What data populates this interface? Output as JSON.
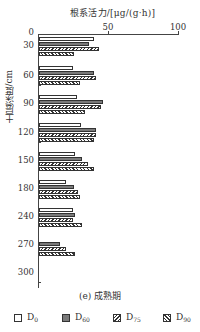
{
  "chart_data": {
    "type": "bar",
    "orientation": "horizontal",
    "title": "",
    "caption": "(e) 成熟期",
    "xlabel": "根系活力/[μg/(g·h)]",
    "ylabel": "土层深度/cm",
    "xlim": [
      0,
      100
    ],
    "x_ticks": [
      "50",
      "100"
    ],
    "categories": [
      "30",
      "60",
      "90",
      "120",
      "150",
      "180",
      "240",
      "270"
    ],
    "y_ticks": [
      "0",
      "30",
      "60",
      "90",
      "120",
      "150",
      "180",
      "240",
      "270",
      "300"
    ],
    "series": [
      {
        "name": "D0",
        "pattern": "white",
        "values": [
          39,
          24,
          27,
          30,
          26,
          19,
          24,
          0
        ]
      },
      {
        "name": "D60",
        "pattern": "gray",
        "values": [
          36,
          39,
          46,
          41,
          31,
          25,
          26,
          15
        ]
      },
      {
        "name": "D75",
        "pattern": "hatch-forward",
        "values": [
          43,
          41,
          44,
          41,
          35,
          28,
          24,
          19
        ]
      },
      {
        "name": "D90",
        "pattern": "hatch-back",
        "values": [
          25,
          29,
          33,
          39,
          39,
          29,
          31,
          26
        ]
      }
    ],
    "legend_position": "bottom",
    "grid": false
  },
  "legend": [
    {
      "base": "D",
      "sub": "0"
    },
    {
      "base": "D",
      "sub": "60"
    },
    {
      "base": "D",
      "sub": "75"
    },
    {
      "base": "D",
      "sub": "90"
    }
  ],
  "colors": {
    "axis": "#444444",
    "d60_fill": "#7a7a7a",
    "hatch": "#333333"
  }
}
